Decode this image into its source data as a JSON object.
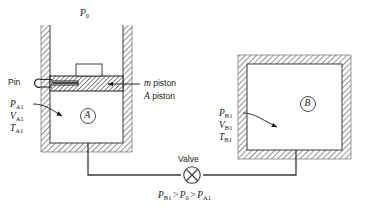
{
  "figure": {
    "name": "piston-cylinder-and-tank-with-valve",
    "ambient_label": "P",
    "ambient_sub": "0"
  },
  "cylinder_A": {
    "chamber_letter": "A",
    "pin_label": "Pin",
    "piston_mass_label_sym": "m",
    "piston_mass_label_word": "piston",
    "piston_area_label_sym": "A",
    "piston_area_label_word": "piston",
    "state_labels": [
      {
        "sym": "P",
        "sub": "A1"
      },
      {
        "sym": "V",
        "sub": "A1"
      },
      {
        "sym": "T",
        "sub": "A1"
      }
    ]
  },
  "tank_B": {
    "chamber_letter": "B",
    "state_labels": [
      {
        "sym": "P",
        "sub": "B1"
      },
      {
        "sym": "V",
        "sub": "B1"
      },
      {
        "sym": "T",
        "sub": "B1"
      }
    ]
  },
  "valve": {
    "label": "Valve",
    "icon": "valve-cross-circle-icon"
  },
  "relation": {
    "term1_sym": "P",
    "term1_sub": "B1",
    "op1": ">",
    "term2_sym": "P",
    "term2_sub": "0",
    "op2": ">",
    "term3_sym": "P",
    "term3_sub": "A1"
  },
  "colors": {
    "ink": "#1a1a1a",
    "line": "#3a3a3a",
    "hatch": "#555555",
    "background": "#ffffff"
  }
}
